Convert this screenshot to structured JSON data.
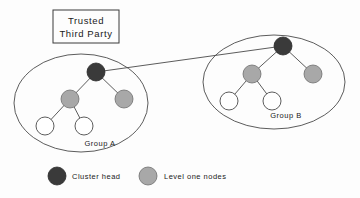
{
  "figure": {
    "title_box": {
      "line1": "Trusted",
      "line2": "Third Party",
      "x": 53,
      "y": 10,
      "width": 66,
      "height": 33
    },
    "colors": {
      "cluster_head": "#3a3a3a",
      "level_one": "#a8a8a8",
      "leaf": "#ffffff",
      "stroke": "#4a4a4a",
      "text": "#1a1a1a",
      "background": "#fdfdfd"
    },
    "groups": [
      {
        "id": "group-a",
        "label": "Group A",
        "label_x": 100,
        "label_y": 146,
        "ellipse": {
          "cx": 81,
          "cy": 103,
          "rx": 67,
          "ry": 49
        },
        "nodes": [
          {
            "id": "a-head",
            "role": "cluster_head",
            "cx": 96,
            "cy": 72,
            "r": 9
          },
          {
            "id": "a-l1-1",
            "role": "level_one",
            "cx": 70,
            "cy": 99,
            "r": 9
          },
          {
            "id": "a-l1-2",
            "role": "level_one",
            "cx": 124,
            "cy": 99,
            "r": 9
          },
          {
            "id": "a-leaf-1",
            "role": "leaf",
            "cx": 45,
            "cy": 126,
            "r": 9
          },
          {
            "id": "a-leaf-2",
            "role": "leaf",
            "cx": 84,
            "cy": 126,
            "r": 9
          }
        ],
        "edges": [
          {
            "from": "a-head",
            "to": "a-l1-1"
          },
          {
            "from": "a-head",
            "to": "a-l1-2"
          },
          {
            "from": "a-l1-1",
            "to": "a-leaf-1"
          },
          {
            "from": "a-l1-1",
            "to": "a-leaf-2"
          }
        ]
      },
      {
        "id": "group-b",
        "label": "Group B",
        "label_x": 286,
        "label_y": 118,
        "ellipse": {
          "cx": 274,
          "cy": 82,
          "rx": 71,
          "ry": 47
        },
        "nodes": [
          {
            "id": "b-head",
            "role": "cluster_head",
            "cx": 283,
            "cy": 46,
            "r": 9
          },
          {
            "id": "b-l1-1",
            "role": "level_one",
            "cx": 252,
            "cy": 74,
            "r": 9
          },
          {
            "id": "b-l1-2",
            "role": "level_one",
            "cx": 313,
            "cy": 74,
            "r": 9
          },
          {
            "id": "b-leaf-1",
            "role": "leaf",
            "cx": 229,
            "cy": 101,
            "r": 9
          },
          {
            "id": "b-leaf-2",
            "role": "leaf",
            "cx": 272,
            "cy": 101,
            "r": 9
          }
        ],
        "edges": [
          {
            "from": "b-head",
            "to": "b-l1-1"
          },
          {
            "from": "b-head",
            "to": "b-l1-2"
          },
          {
            "from": "b-l1-1",
            "to": "b-leaf-1"
          },
          {
            "from": "b-l1-1",
            "to": "b-leaf-2"
          }
        ]
      }
    ],
    "inter_cluster_link": {
      "x1": 96,
      "y1": 72,
      "x2": 283,
      "y2": 46
    },
    "legend": {
      "items": [
        {
          "id": "legend-cluster-head",
          "label": "Cluster head",
          "role": "cluster_head",
          "cx": 57,
          "cy": 176,
          "r": 9,
          "label_x": 72,
          "label_y": 179
        },
        {
          "id": "legend-level-one",
          "label": "Level one nodes",
          "role": "level_one",
          "cx": 148,
          "cy": 176,
          "r": 9,
          "label_x": 164,
          "label_y": 179
        }
      ]
    }
  }
}
